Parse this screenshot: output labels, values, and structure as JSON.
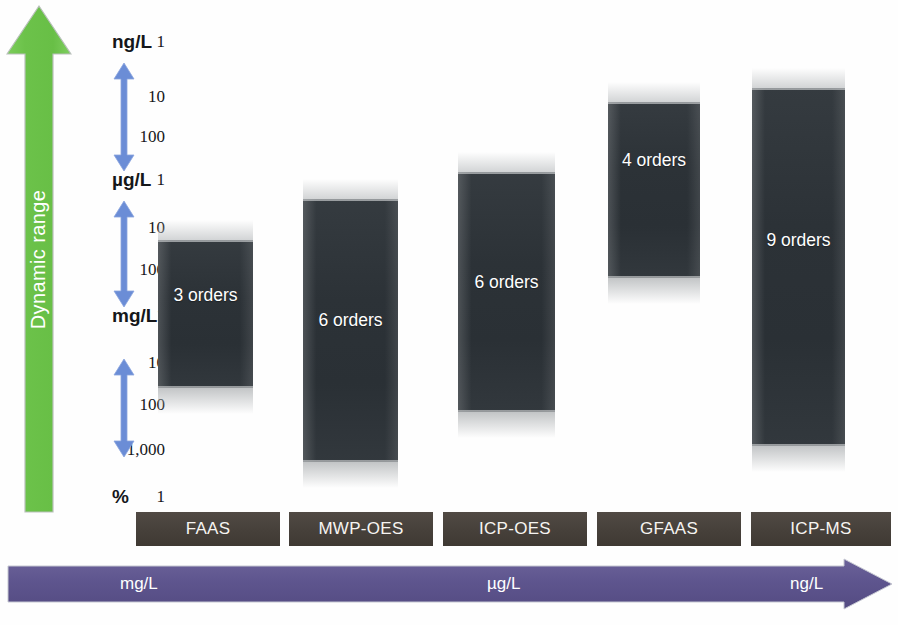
{
  "figure": {
    "dynamic_range_label": "Dynamic range"
  },
  "axis": {
    "ticks": [
      {
        "number": "1",
        "unit": "ng/L",
        "y": 42
      },
      {
        "number": "10",
        "unit": "",
        "y": 97
      },
      {
        "number": "100",
        "unit": "",
        "y": 137
      },
      {
        "number": "1",
        "unit": "µg/L",
        "y": 180
      },
      {
        "number": "10",
        "unit": "",
        "y": 228
      },
      {
        "number": "100",
        "unit": "",
        "y": 270
      },
      {
        "number": "1",
        "unit": "mg/L",
        "y": 316
      },
      {
        "number": "10",
        "unit": "",
        "y": 363
      },
      {
        "number": "100",
        "unit": "",
        "y": 405
      },
      {
        "number": "1,000",
        "unit": "",
        "y": 450
      },
      {
        "number": "1",
        "unit": "%",
        "y": 497
      }
    ],
    "decade_arrows": [
      {
        "top": 62,
        "height": 110
      },
      {
        "top": 200,
        "height": 108
      },
      {
        "top": 358,
        "height": 100
      }
    ]
  },
  "concentration_axis": {
    "labels": [
      {
        "text": "mg/L",
        "x": 120
      },
      {
        "text": "µg/L",
        "x": 487
      },
      {
        "text": "ng/L",
        "x": 790
      }
    ]
  },
  "chart_data": {
    "type": "bar",
    "xlabel": "Technique",
    "ylabel": "Dynamic range",
    "ylim": [
      "1 ng/L",
      "1 %"
    ],
    "grid": false,
    "legend": "none",
    "y_axis_ticks": [
      "1 ng/L",
      "10",
      "100",
      "1 µg/L",
      "10",
      "100",
      "1 mg/L",
      "10",
      "100",
      "1,000",
      "1 %"
    ],
    "categories": [
      "FAAS",
      "MWP-OES",
      "ICP-OES",
      "GFAAS",
      "ICP-MS"
    ],
    "values": [
      3,
      6,
      6,
      4,
      9
    ],
    "value_unit": "orders of magnitude",
    "data_labels": [
      "3 orders",
      "6 orders",
      "6 orders",
      "4 orders",
      "9 orders"
    ],
    "bars": [
      {
        "name": "FAAS",
        "orders": "3 orders",
        "x": 158,
        "width": 95,
        "top": 240,
        "height": 148,
        "label_y": 295
      },
      {
        "name": "MWP-OES",
        "orders": "6 orders",
        "x": 303,
        "width": 95,
        "top": 199,
        "height": 263,
        "label_y": 320
      },
      {
        "name": "ICP-OES",
        "orders": "6 orders",
        "x": 458,
        "width": 97,
        "top": 172,
        "height": 240,
        "label_y": 282
      },
      {
        "name": "GFAAS",
        "orders": "4 orders",
        "x": 608,
        "width": 92,
        "top": 102,
        "height": 176,
        "label_y": 160
      },
      {
        "name": "ICP-MS",
        "orders": "9 orders",
        "x": 752,
        "width": 93,
        "top": 88,
        "height": 358,
        "label_y": 240
      }
    ],
    "tech_boxes": [
      {
        "label": "FAAS",
        "x": 136,
        "width": 144
      },
      {
        "label": "MWP-OES",
        "x": 289,
        "width": 144
      },
      {
        "label": "ICP-OES",
        "x": 443,
        "width": 144
      },
      {
        "label": "GFAAS",
        "x": 597,
        "width": 144
      },
      {
        "label": "ICP-MS",
        "x": 751,
        "width": 140
      }
    ]
  },
  "colors": {
    "dynamic_range_arrow": "#6cc24a",
    "decade_arrow": "#6b8dd6",
    "bar_fill": "#2e3438",
    "tech_box": "#46403a",
    "concentration_arrow": "#5e558e",
    "background": "#fefefe"
  }
}
